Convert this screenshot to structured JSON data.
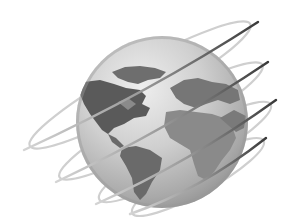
{
  "image": {
    "subject": "globe-with-orbit-rings",
    "description": "Grayscale globe showing the Americas, Europe and Africa, encircled by four tilted orbital rings",
    "colors": {
      "background": "#ffffff",
      "ocean_light": "#e6e6e6",
      "ocean_mid": "#b9b9b9",
      "ocean_dark": "#8e8e8e",
      "land_dark": "#5a5a5a",
      "land_mid": "#7a7a7a",
      "ring": "#3a3a3a",
      "ring_faded": "#c8c8c8"
    },
    "globe": {
      "cx": 162,
      "cy": 122,
      "r": 86
    },
    "ring_count": 4
  }
}
